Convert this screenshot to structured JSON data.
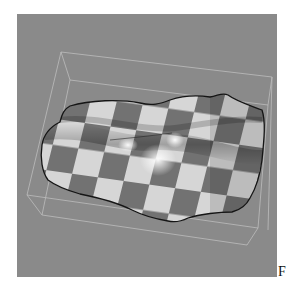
{
  "figure": {
    "panel_label": "F",
    "background_color": "#8a8a8a",
    "wireframe_color": "#c8c8c8",
    "outline_color": "#111111",
    "checker_light": "#d8d8d8",
    "checker_dark": "#707070",
    "highlight": "#f4f4f4"
  }
}
